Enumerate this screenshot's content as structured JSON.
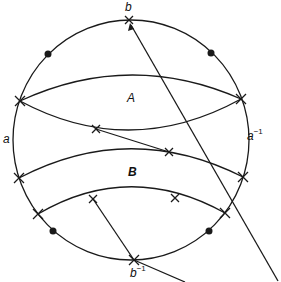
{
  "labels": {
    "top": "b",
    "bottom": "b",
    "bottom_sup": "−1",
    "left": "a",
    "right": "a",
    "right_sup": "−1",
    "region_A": "A",
    "region_B": "B"
  },
  "colors": {
    "stroke": "#1a1a1a",
    "background": "#ffffff"
  }
}
